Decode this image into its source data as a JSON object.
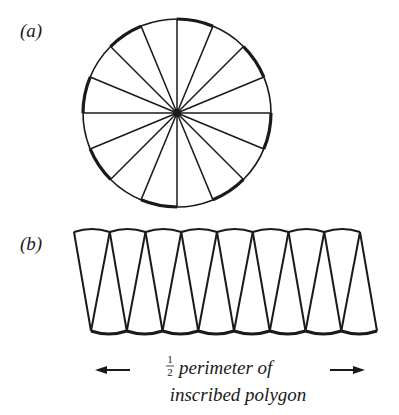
{
  "figure": {
    "panel_a": {
      "label": "(a)",
      "description": "circle divided into equal sectors",
      "sector_count": 16
    },
    "panel_b": {
      "label": "(b)",
      "description": "sectors rearranged alternately into an approximate parallelogram",
      "sector_count": 16
    },
    "caption": {
      "fraction_num": "1",
      "fraction_den": "2",
      "line1": "perimeter of",
      "line2": "inscribed polygon"
    },
    "colors": {
      "ink": "#1a1a1a",
      "background": "#ffffff"
    }
  }
}
